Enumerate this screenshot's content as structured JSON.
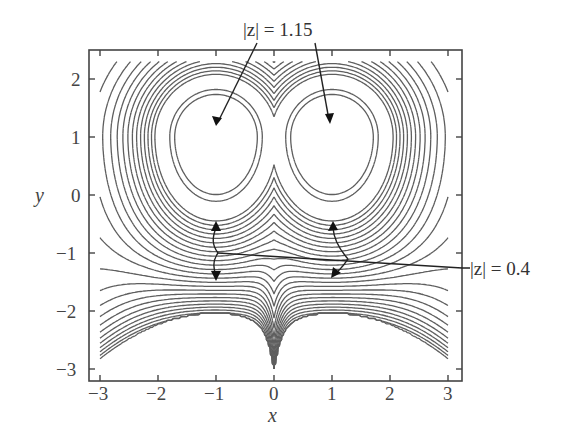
{
  "chart_data": {
    "type": "contour",
    "title": "",
    "xlabel": "x",
    "ylabel": "y",
    "xlim": [
      -3.2,
      3.2
    ],
    "ylim": [
      -3.2,
      2.5
    ],
    "xticks": [
      -3,
      -2,
      -1,
      0,
      1,
      2,
      3
    ],
    "yticks": [
      -3,
      -2,
      -1,
      0,
      1,
      2
    ],
    "xtick_labels": [
      "−3",
      "−2",
      "−1",
      "0",
      "1",
      "2",
      "3"
    ],
    "ytick_labels": [
      "−3",
      "−2",
      "−1",
      "0",
      "1",
      "2"
    ],
    "grid": false,
    "legend": null,
    "critical_points": [
      {
        "type": "maximum",
        "x": -1,
        "y": 1,
        "value": 1.15
      },
      {
        "type": "maximum",
        "x": 1,
        "y": 1,
        "value": 1.15
      },
      {
        "type": "saddle",
        "x": -1,
        "y": -1,
        "value": 0.4
      },
      {
        "type": "saddle",
        "x": 1,
        "y": -1,
        "value": 0.4
      }
    ],
    "annotations": [
      {
        "text": "|z| = 1.15",
        "points_to": [
          [
            -1,
            1.15
          ],
          [
            1,
            1.15
          ]
        ]
      },
      {
        "text": "|z| = 0.4",
        "points_to": [
          [
            -1,
            -1
          ],
          [
            1,
            -1
          ]
        ]
      }
    ],
    "line_color": "#5a5a5a"
  },
  "labels": {
    "x_axis": "x",
    "y_axis": "y",
    "annot_max": "|z| = 1.15",
    "annot_saddle": "|z| = 0.4",
    "xticks": [
      "−3",
      "−2",
      "−1",
      "0",
      "1",
      "2",
      "3"
    ],
    "yticks": [
      "2",
      "1",
      "0",
      "−1",
      "−2",
      "−3"
    ]
  }
}
